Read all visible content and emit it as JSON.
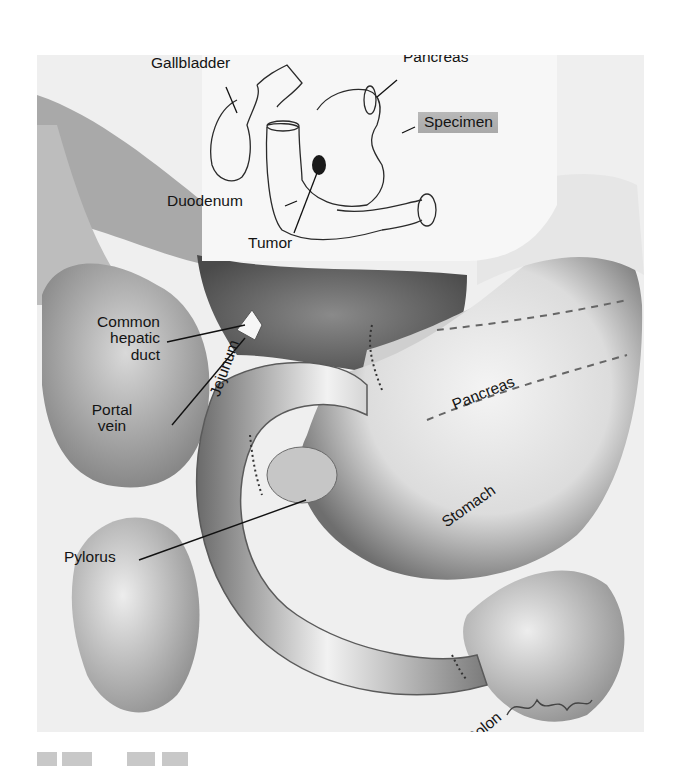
{
  "figure": {
    "type": "surgical illustration",
    "inset_labels": {
      "gallbladder": "Gallbladder",
      "pancreas": "Pancreas",
      "specimen": "Specimen",
      "duodenum": "Duodenum",
      "tumor": "Tumor"
    },
    "main_labels": {
      "common_hepatic_duct_line1": "Common",
      "common_hepatic_duct_line2": "hepatic",
      "common_hepatic_duct_line3": "duct",
      "portal_vein_line1": "Portal",
      "portal_vein_line2": "vein",
      "jejunum": "Jejunum",
      "pancreas": "Pancreas",
      "stomach": "Stomach",
      "pylorus": "Pylorus",
      "colon": "Colon"
    },
    "colors": {
      "label_text": "#141414",
      "specimen_highlight": "#b0b0b0",
      "background": "#ffffff"
    }
  }
}
